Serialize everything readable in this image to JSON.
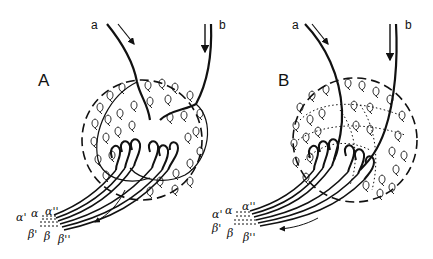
{
  "figure": {
    "panels": [
      {
        "id": "A",
        "label": "A",
        "inputs": [
          {
            "label": "a"
          },
          {
            "label": "b"
          }
        ],
        "output_labels_top": [
          "α'",
          "α",
          "α''"
        ],
        "output_labels_bottom": [
          "β'",
          "β",
          "β''"
        ],
        "style": "solid-boundaries"
      },
      {
        "id": "B",
        "label": "B",
        "inputs": [
          {
            "label": "a"
          },
          {
            "label": "b"
          }
        ],
        "output_labels_top": [
          "α'",
          "α",
          "α''"
        ],
        "output_labels_bottom": [
          "β'",
          "β",
          "β''"
        ],
        "style": "dotted-boundaries"
      }
    ],
    "colors": {
      "ink": "#111111",
      "background": "#ffffff"
    }
  }
}
